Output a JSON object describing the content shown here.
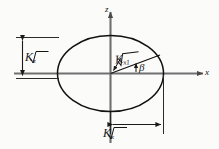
{
  "figure": {
    "type": "technical-diagram",
    "background_color": "#fbfbfa",
    "ink_color": "#181818",
    "axis_color": "#6e6e6e"
  },
  "axes": {
    "horizontal": {
      "name": "x-axis",
      "label": "x",
      "arrow": "right"
    },
    "vertical": {
      "name": "z-axis",
      "label": "z",
      "arrow": "up"
    }
  },
  "ellipse": {
    "name": "ellipse-curve",
    "center_label": "origin",
    "semi_major_label": "√K",
    "semi_major_subscript": "x",
    "semi_minor_label": "√K",
    "semi_minor_subscript": "z"
  },
  "labels": {
    "vertical_dimension": {
      "radical": "√",
      "variable": "K",
      "subscript": "z",
      "full": "√K_z"
    },
    "horizontal_dimension": {
      "radical": "√",
      "variable": "K",
      "subscript": "x",
      "full": "√K_x"
    },
    "radius_vector": {
      "radical": "√",
      "variable": "K",
      "subscript": "x1",
      "full": "√K_x1"
    },
    "angle": {
      "symbol": "β",
      "name": "beta"
    }
  },
  "annotations": {
    "vertical_dimension_line": "double-headed arrow between upper extension line and x-axis level",
    "horizontal_dimension_line": "double-headed arrow from z-axis to right edge of ellipse",
    "leader_arrow": "short arrow pointing down-left from the radius label to the radius line",
    "angle_arrow": "short upward arrow indicating angle beta above the x-axis"
  }
}
